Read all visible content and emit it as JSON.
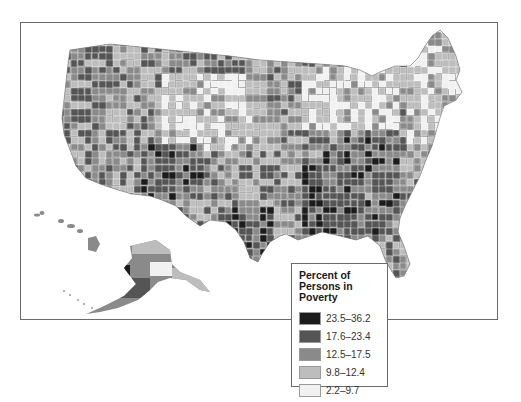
{
  "map": {
    "subject": "United States counties",
    "shading_variable": "Percent of Persons in Poverty"
  },
  "legend": {
    "title": "Percent of Persons in Poverty",
    "items": [
      {
        "label": "23.5–36.2",
        "color": "#1c1c1c"
      },
      {
        "label": "17.6–23.4",
        "color": "#555555"
      },
      {
        "label": "12.5–17.5",
        "color": "#8a8a8a"
      },
      {
        "label": "9.8–12.4",
        "color": "#bdbdbd"
      },
      {
        "label": "2.2–9.7",
        "color": "#f1f1f1"
      }
    ]
  },
  "colors": {
    "frame_border": "#6a6a6a",
    "county_border": "#ffffff"
  }
}
